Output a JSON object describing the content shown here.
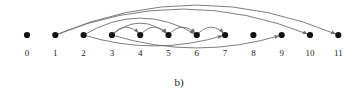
{
  "figure": {
    "caption": "b)",
    "type": "arc-diagram",
    "baseline_y": 35,
    "node_radius": 3.1,
    "node_color": "#121212",
    "arc_color": "#6e6e6e",
    "arc_width": 0.9,
    "label_y": 48,
    "nodes": [
      {
        "label": "0",
        "x": 27.0
      },
      {
        "label": "1",
        "x": 55.3
      },
      {
        "label": "2",
        "x": 83.6
      },
      {
        "label": "3",
        "x": 111.9
      },
      {
        "label": "4",
        "x": 140.2
      },
      {
        "label": "5",
        "x": 168.5
      },
      {
        "label": "6",
        "x": 196.8
      },
      {
        "label": "7",
        "x": 225.1
      },
      {
        "label": "8",
        "x": 253.4
      },
      {
        "label": "9",
        "x": 281.7
      },
      {
        "label": "10",
        "x": 310.0
      },
      {
        "label": "11",
        "x": 338.3
      }
    ],
    "edges": [
      {
        "from": 1,
        "to": 11,
        "side": "top",
        "height": 30,
        "arrow": true
      },
      {
        "from": 1,
        "to": 10,
        "side": "top",
        "height": 26,
        "arrow": true
      },
      {
        "from": 2,
        "to": 6,
        "side": "top",
        "height": 17,
        "arrow": true
      },
      {
        "from": 3,
        "to": 5,
        "side": "top",
        "height": 12,
        "arrow": true
      },
      {
        "from": 3,
        "to": 4,
        "side": "top",
        "height": 8,
        "arrow": true
      },
      {
        "from": 4,
        "to": 5,
        "side": "top",
        "height": 8,
        "arrow": true
      },
      {
        "from": 5,
        "to": 6,
        "side": "top",
        "height": 8,
        "arrow": true
      },
      {
        "from": 6,
        "to": 7,
        "side": "top",
        "height": 8,
        "arrow": true
      },
      {
        "from": 2,
        "to": 7,
        "side": "bottom",
        "height": 11,
        "arrow": true
      },
      {
        "from": 3,
        "to": 9,
        "side": "bottom",
        "height": 13,
        "arrow": true
      }
    ]
  }
}
